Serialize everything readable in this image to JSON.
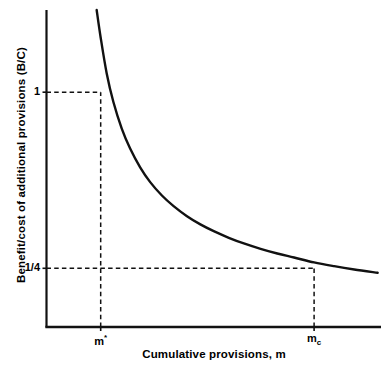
{
  "chart_data": {
    "type": "line",
    "title": "",
    "xlabel": "Cumulative provisions, m",
    "ylabel": "Benefit/cost of additional provisions (B/C)",
    "grid": false,
    "legend": null,
    "curve_label": "benefit-cost-curve",
    "curve_color": "#111111",
    "guide_color": "#111111",
    "axis_color": "#111111",
    "xlim": [
      0,
      1
    ],
    "ylim": [
      0,
      1.35
    ],
    "yticks": [
      {
        "label": "1",
        "value": 1
      },
      {
        "label": "1/4",
        "value": 0.25
      }
    ],
    "xticks": [
      {
        "label_main": "m",
        "label_sup": "*",
        "label_sub": "",
        "name": "m-star",
        "value": 0.162
      },
      {
        "label_main": "m",
        "label_sup": "",
        "label_sub": "c",
        "name": "m-c",
        "value": 0.8
      }
    ],
    "annotations": [
      {
        "name": "guide-y-1",
        "type": "dashed-horizontal",
        "y": 1,
        "x_from": 0,
        "x_to": 0.162
      },
      {
        "name": "guide-x-mstar",
        "type": "dashed-vertical",
        "x": 0.162,
        "y_from": 0,
        "y_to": 1
      },
      {
        "name": "guide-y-quarter",
        "type": "dashed-horizontal",
        "y": 0.25,
        "x_from": 0,
        "x_to": 0.8
      },
      {
        "name": "guide-x-mc",
        "type": "dashed-vertical",
        "x": 0.8,
        "y_from": 0,
        "y_to": 0.25
      }
    ],
    "x": [
      0.15,
      0.162,
      0.18,
      0.2,
      0.225,
      0.25,
      0.28,
      0.31,
      0.345,
      0.38,
      0.42,
      0.46,
      0.5,
      0.545,
      0.59,
      0.64,
      0.69,
      0.74,
      0.8,
      0.86,
      0.92,
      0.99
    ],
    "y": [
      1.35,
      1.232,
      1.08,
      0.958,
      0.845,
      0.76,
      0.68,
      0.617,
      0.56,
      0.515,
      0.472,
      0.437,
      0.408,
      0.38,
      0.356,
      0.333,
      0.313,
      0.296,
      0.275,
      0.259,
      0.245,
      0.231
    ]
  }
}
